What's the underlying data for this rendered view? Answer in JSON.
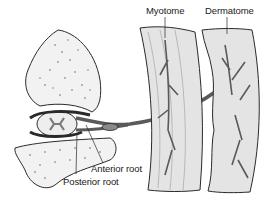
{
  "diagram": {
    "labels": {
      "myotome": "Myotome",
      "dermatome": "Dermatome",
      "anterior_root": "Anterior root",
      "posterior_root": "Posterior root"
    },
    "colors": {
      "background": "#ffffff",
      "outline": "#2a2a2a",
      "tissue_fill": "#e4e4e4",
      "bone_fill": "#f2f2f2",
      "nerve_fill": "#9a9a9a",
      "label_text": "#1a1a1a"
    }
  }
}
